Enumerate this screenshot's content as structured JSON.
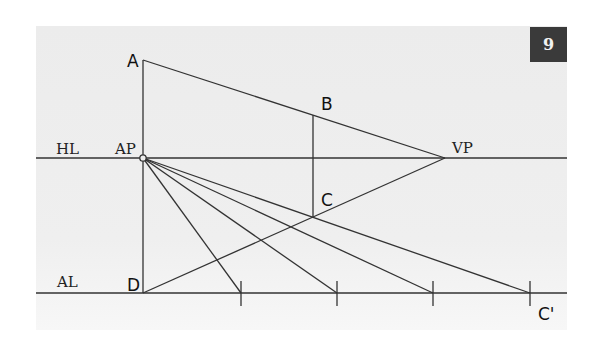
{
  "figure": {
    "badge_number": "9",
    "labels": {
      "horizon_line": "HL",
      "auxiliary_line": "AL",
      "auxiliary_point": "AP",
      "vanishing_point": "VP",
      "point_a": "A",
      "point_b": "B",
      "point_c": "C",
      "point_d": "D",
      "point_c_prime": "C'"
    },
    "colors": {
      "panel_background": "#ececec",
      "line": "#333333",
      "badge_background": "#3a3a3a",
      "badge_text": "#f2f2f2"
    },
    "points": {
      "A": [
        143,
        60
      ],
      "AP": [
        143,
        158
      ],
      "D": [
        143,
        293
      ],
      "VP": [
        445,
        158
      ],
      "B": [
        313,
        115
      ],
      "C": [
        313,
        218
      ]
    },
    "auxiliary_ticks_x": [
      241,
      337,
      433,
      530
    ]
  }
}
